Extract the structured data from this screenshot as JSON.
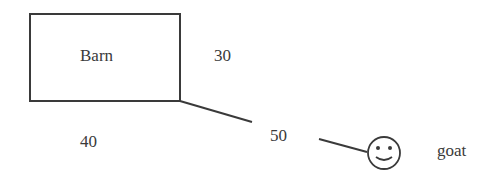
{
  "diagram": {
    "barn": {
      "label": "Barn"
    },
    "dimensions": {
      "side": "30",
      "bottom": "40",
      "rope": "50"
    },
    "animal": {
      "label": "goat",
      "icon": "smiley-face-icon"
    },
    "colors": {
      "stroke": "#3a3a3a",
      "background": "#ffffff"
    }
  }
}
